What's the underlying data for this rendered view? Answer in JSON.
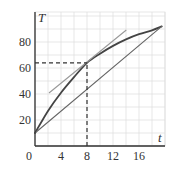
{
  "chart_data": {
    "type": "line",
    "title": "",
    "xlabel": "t",
    "ylabel": "T",
    "xlim": [
      0,
      20
    ],
    "ylim": [
      0,
      90
    ],
    "grid": true,
    "x_ticks": [
      "0",
      "4",
      "8",
      "12",
      "16"
    ],
    "y_ticks": [
      "20",
      "40",
      "60",
      "80"
    ],
    "series": [
      {
        "name": "curve",
        "style": "thick dark",
        "x": [
          0,
          2,
          4,
          6,
          8,
          10,
          12,
          14,
          16,
          18,
          19.5
        ],
        "y": [
          10,
          27,
          41,
          53,
          64,
          71,
          77,
          82,
          86,
          89,
          92
        ]
      },
      {
        "name": "secant",
        "style": "thin gray",
        "x": [
          0,
          19.5
        ],
        "y": [
          10,
          92
        ]
      },
      {
        "name": "tangent",
        "style": "thin light gray",
        "x": [
          2.2,
          14
        ],
        "y": [
          41,
          89
        ]
      }
    ],
    "annotations": [
      {
        "type": "dashed-vertical",
        "x": 8,
        "from_y": 0,
        "to_y": 64
      },
      {
        "type": "dashed-horizontal",
        "y": 64,
        "from_x": 0,
        "to_x": 8
      },
      {
        "type": "point",
        "x": 8,
        "y": 64
      }
    ],
    "colors": {
      "grid": "#dcdcdc",
      "axis": "#333333",
      "curve": "#444444",
      "secant": "#666666",
      "tangent": "#999999",
      "dashed": "#333333"
    }
  }
}
